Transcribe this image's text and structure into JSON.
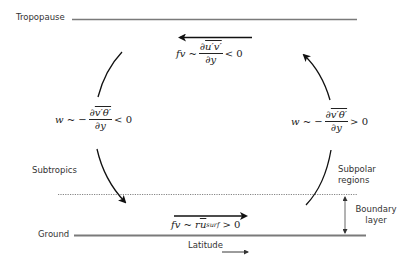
{
  "labels": {
    "tropopause": "Tropopause",
    "subtropics": "Subtropics",
    "subpolar_line1": "Subpolar",
    "subpolar_line2": "regions",
    "boundary_line1": "Boundary",
    "boundary_line2": "layer",
    "ground": "Ground",
    "latitude": "Latitude"
  },
  "equations": {
    "upper": {
      "lhs": "fv ~",
      "num": "∂",
      "num_over": "u′v′",
      "den": "∂y",
      "rhs": "< 0"
    },
    "left": {
      "lhs": "w ~ −",
      "num": "∂",
      "num_over": "v′θ′",
      "den": "∂y",
      "rhs": "< 0"
    },
    "right": {
      "lhs": "w ~ −",
      "num": "∂",
      "num_over": "v′θ′",
      "den": "∂y",
      "rhs": "> 0"
    },
    "surface": {
      "lhs": "fv ~ r",
      "ubar": "u",
      "sub": "surf",
      "rhs": " > 0"
    }
  },
  "colors": {
    "line": "#777777",
    "arrow": "#111111",
    "text": "#333333"
  }
}
